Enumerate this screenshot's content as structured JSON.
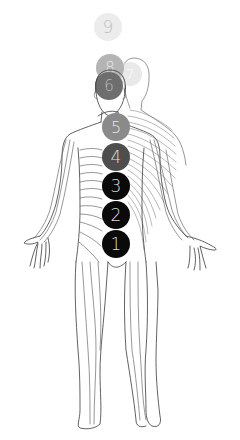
{
  "figure": {
    "circles": [
      {
        "label": "9",
        "cx": 108,
        "cy": 27,
        "r": 14,
        "fill": "#ececec",
        "text_color": "#c0c0c0",
        "opacity": 1
      },
      {
        "label": "8",
        "cx": 110,
        "cy": 68,
        "r": 14,
        "fill": "#b4b4b4",
        "text_color": "#e6e6e6",
        "opacity": 1
      },
      {
        "label": "7",
        "cx": 130,
        "cy": 74,
        "r": 12,
        "fill": "#e4e4e4",
        "text_color": "#ffffff",
        "opacity": 0.8
      },
      {
        "label": "6",
        "cx": 109,
        "cy": 86,
        "r": 14,
        "fill": "#6e6e6e",
        "text_color": "#b8b8b8",
        "opacity": 1
      },
      {
        "label": "5",
        "cx": 116,
        "cy": 127,
        "r": 14,
        "fill": "#8a8a8a",
        "text_color": "#e8e8e8",
        "opacity": 1
      },
      {
        "label": "4",
        "cx": 116,
        "cy": 157,
        "r": 14,
        "fill": "#4e4e4e",
        "text_color": "#dcdcdc",
        "opacity": 1
      },
      {
        "label": "3",
        "cx": 116,
        "cy": 186,
        "r": 14,
        "fill": "#0a0a0a",
        "text_color": "#dcdcdc",
        "opacity": 1
      },
      {
        "label": "2",
        "cx": 116,
        "cy": 215,
        "r": 14,
        "fill": "#0a0a0a",
        "text_color": "#dcdcdc",
        "opacity": 1
      },
      {
        "label": "1",
        "cx": 116,
        "cy": 244,
        "r": 14,
        "fill": "#0a0a0a",
        "text_color": "#dcdcdc",
        "opacity": 1
      }
    ],
    "colors": {
      "background": "#ffffff",
      "outline": "#3a3a3a"
    }
  }
}
